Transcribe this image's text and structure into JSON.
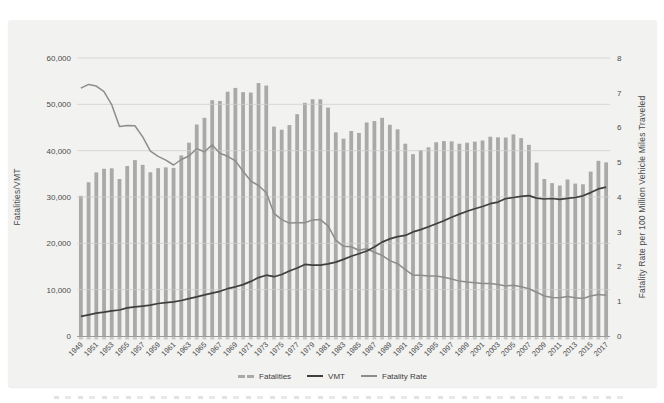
{
  "colors": {
    "page_bg": "#ffffff",
    "panel_bg": "#f2f2f1",
    "bars": "#a9a9a8",
    "vmt_line": "#3f3f3f",
    "rate_line": "#8d8d8c",
    "gridline": "#cfcfce",
    "axis_line": "#9c9c9b",
    "tick_stub": "#c4c4c3",
    "text": "#4b4b4b"
  },
  "chart_data": {
    "type": "bar",
    "subtype": "combo-bar-line-dual-axis",
    "title": "",
    "x": [
      1949,
      1950,
      1951,
      1952,
      1953,
      1954,
      1955,
      1956,
      1957,
      1958,
      1959,
      1960,
      1961,
      1962,
      1963,
      1964,
      1965,
      1966,
      1967,
      1968,
      1969,
      1970,
      1971,
      1972,
      1973,
      1974,
      1975,
      1976,
      1977,
      1978,
      1979,
      1980,
      1981,
      1982,
      1983,
      1984,
      1985,
      1986,
      1987,
      1988,
      1989,
      1990,
      1991,
      1992,
      1993,
      1994,
      1995,
      1996,
      1997,
      1998,
      1999,
      2000,
      2001,
      2002,
      2003,
      2004,
      2005,
      2006,
      2007,
      2008,
      2009,
      2010,
      2011,
      2012,
      2013,
      2014,
      2015,
      2016,
      2017
    ],
    "x_label_step": 2,
    "left_axis": {
      "title": "Fatalities/VMT",
      "min": 0,
      "max": 60000,
      "tick_step": 10000,
      "ticks": [
        "0",
        "10,000",
        "20,000",
        "30,000",
        "40,000",
        "50,000",
        "60,000"
      ]
    },
    "right_axis": {
      "title": "Fatality Rate per 100 Million Vehicle Miles Traveled",
      "min": 0,
      "max": 8,
      "tick_step": 1,
      "ticks": [
        "0",
        "1",
        "2",
        "3",
        "4",
        "5",
        "6",
        "7",
        "8"
      ]
    },
    "grid": {
      "horizontal": true,
      "vertical": false
    },
    "series": [
      {
        "name": "Fatalities",
        "type": "bar",
        "axis": "left",
        "color": "#a9a9a8",
        "values": [
          30246,
          33186,
          35309,
          36088,
          36190,
          33890,
          36688,
          37965,
          36932,
          35331,
          36223,
          36399,
          36285,
          38980,
          41723,
          45645,
          47089,
          50894,
          50724,
          52725,
          53543,
          52627,
          52542,
          54589,
          54052,
          45196,
          44525,
          45523,
          47878,
          50331,
          51093,
          51091,
          49301,
          43945,
          42589,
          44257,
          43825,
          46087,
          46390,
          47087,
          45582,
          44599,
          41508,
          39250,
          40150,
          40716,
          41817,
          42065,
          42013,
          41501,
          41717,
          41945,
          42196,
          43005,
          42884,
          42836,
          43510,
          42708,
          41259,
          37423,
          33883,
          32999,
          32479,
          33782,
          32893,
          32744,
          35484,
          37806,
          37473
        ]
      },
      {
        "name": "VMT",
        "type": "line",
        "axis": "left",
        "units": "100 million miles",
        "color": "#3f3f3f",
        "values": [
          4245,
          4582,
          4911,
          5136,
          5444,
          5620,
          6056,
          6278,
          6450,
          6647,
          7005,
          7188,
          7374,
          7667,
          8052,
          8463,
          8878,
          9259,
          9640,
          10199,
          10618,
          11097,
          11788,
          12598,
          13131,
          12805,
          13277,
          14024,
          14670,
          15447,
          15291,
          15273,
          15553,
          15950,
          16528,
          17203,
          17748,
          18349,
          19212,
          20260,
          20965,
          21444,
          21721,
          22472,
          22964,
          23576,
          24227,
          24858,
          25617,
          26315,
          26911,
          27469,
          27956,
          28555,
          28905,
          29648,
          29894,
          30141,
          30311,
          29765,
          29568,
          29673,
          29504,
          29694,
          29883,
          30257,
          30954,
          31744,
          32123
        ]
      },
      {
        "name": "Fatality Rate",
        "type": "line",
        "axis": "right",
        "units": "fatalities per 100 million VMT",
        "color": "#8d8d8c",
        "values": [
          7.13,
          7.24,
          7.19,
          7.03,
          6.65,
          6.03,
          6.06,
          6.05,
          5.73,
          5.32,
          5.17,
          5.06,
          4.92,
          5.08,
          5.18,
          5.39,
          5.3,
          5.5,
          5.26,
          5.17,
          5.04,
          4.74,
          4.46,
          4.33,
          4.12,
          3.53,
          3.35,
          3.25,
          3.26,
          3.26,
          3.34,
          3.35,
          3.17,
          2.76,
          2.58,
          2.57,
          2.47,
          2.51,
          2.41,
          2.32,
          2.17,
          2.08,
          1.91,
          1.75,
          1.75,
          1.73,
          1.73,
          1.69,
          1.64,
          1.58,
          1.55,
          1.53,
          1.51,
          1.51,
          1.48,
          1.44,
          1.46,
          1.42,
          1.36,
          1.26,
          1.15,
          1.11,
          1.1,
          1.14,
          1.1,
          1.08,
          1.15,
          1.19,
          1.17
        ]
      }
    ],
    "legend": {
      "position": "bottom-center",
      "items": [
        "Fatalities",
        "VMT",
        "Fatality Rate"
      ]
    }
  }
}
